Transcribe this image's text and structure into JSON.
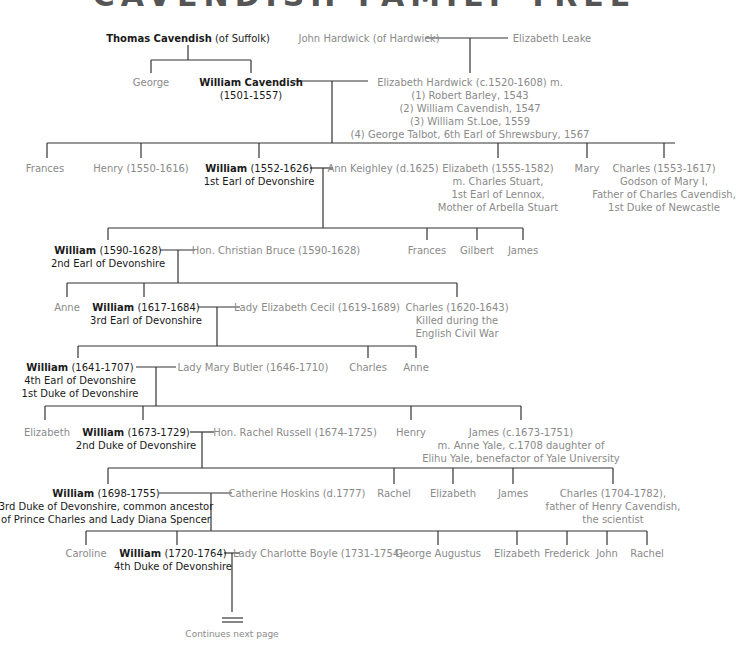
{
  "title": "CAVENDISH FAMILY TREE",
  "people": {
    "thomas": {
      "name": "Thomas Cavendish",
      "rest": " (of Suffolk)"
    },
    "john_hardwick": {
      "name": "John Hardwick (of Hardwick)"
    },
    "elizabeth_leake": {
      "name": "Elizabeth Leake"
    },
    "george": {
      "name": "George"
    },
    "william_1501": {
      "name": "William Cavendish",
      "line2": "(1501-1557)"
    },
    "bess": {
      "name": "Elizabeth Hardwick (c.1520-1608) m.",
      "lines": [
        "(1) Robert Barley, 1543",
        "(2) William Cavendish, 1547",
        "(3) William St.Loe, 1559",
        "(4) George Talbot, 6th Earl of Shrewsbury, 1567"
      ]
    },
    "frances_1": {
      "name": "Frances"
    },
    "henry_1550": {
      "name": "Henry (1550-1616)"
    },
    "william_1552": {
      "name": "William",
      "rest": " (1552-1626)",
      "line2": "1st Earl of Devonshire"
    },
    "ann_keighley": {
      "name": "Ann Keighley (d.1625)"
    },
    "elizabeth_1555": {
      "name": "Elizabeth (1555-1582)",
      "lines": [
        "m.  Charles Stuart,",
        "1st Earl of Lennox,",
        "Mother of Arbella Stuart"
      ]
    },
    "mary": {
      "name": "Mary"
    },
    "charles_1553": {
      "name": "Charles (1553-1617)",
      "lines": [
        "Godson of Mary I,",
        "Father of Charles Cavendish,",
        "1st Duke of Newcastle"
      ]
    },
    "william_1590": {
      "name": "William",
      "rest": " (1590-1628)",
      "line2": "2nd Earl of Devonshire"
    },
    "christian_bruce": {
      "name": "Hon.  Christian Bruce (1590-1628)"
    },
    "frances_2": {
      "name": "Frances"
    },
    "gilbert": {
      "name": "Gilbert"
    },
    "james_1": {
      "name": "James"
    },
    "anne_1": {
      "name": "Anne"
    },
    "william_1617": {
      "name": "William",
      "rest": " (1617-1684)",
      "line2": "3rd Earl of Devonshire"
    },
    "elizabeth_cecil": {
      "name": "Lady Elizabeth Cecil (1619-1689)"
    },
    "charles_1620": {
      "name": "Charles (1620-1643)",
      "lines": [
        "Killed during the",
        "English Civil War"
      ]
    },
    "william_1641": {
      "name": "William",
      "rest": " (1641-1707)",
      "line2": "4th Earl of Devonshire",
      "line3": "1st Duke of Devonshire"
    },
    "mary_butler": {
      "name": "Lady Mary Butler (1646-1710)"
    },
    "charles_2": {
      "name": "Charles"
    },
    "anne_2": {
      "name": "Anne"
    },
    "elizabeth_2": {
      "name": "Elizabeth"
    },
    "william_1673": {
      "name": "William",
      "rest": " (1673-1729)",
      "line2": "2nd Duke of Devonshire"
    },
    "rachel_russell": {
      "name": "Hon.  Rachel Russell (1674-1725)"
    },
    "henry_2": {
      "name": "Henry"
    },
    "james_1673": {
      "name": "James (c.1673-1751)",
      "lines": [
        "m.  Anne Yale, c.1708 daughter of",
        "Elihu Yale, benefactor of Yale University"
      ]
    },
    "william_1698": {
      "name": "William",
      "rest": " (1698-1755)",
      "line2": "3rd Duke of Devonshire, common ancestor",
      "line3": "of Prince Charles and Lady Diana Spencer"
    },
    "catherine_hoskins": {
      "name": "Catherine Hoskins (d.1777)"
    },
    "rachel_1": {
      "name": "Rachel"
    },
    "elizabeth_3": {
      "name": "Elizabeth"
    },
    "james_2": {
      "name": "James"
    },
    "charles_1704": {
      "name": "Charles (1704-1782),",
      "lines": [
        "father of Henry Cavendish,",
        "the scientist"
      ]
    },
    "caroline": {
      "name": "Caroline"
    },
    "william_1720": {
      "name": "William",
      "rest": " (1720-1764)",
      "line2": "4th Duke of Devonshire"
    },
    "charlotte_boyle": {
      "name": "Lady Charlotte Boyle (1731-1754)"
    },
    "george_augustus": {
      "name": "George Augustus"
    },
    "elizabeth_4": {
      "name": "Elizabeth"
    },
    "frederick": {
      "name": "Frederick"
    },
    "john": {
      "name": "John"
    },
    "rachel_2": {
      "name": "Rachel"
    }
  },
  "footer": {
    "continues": "Continues next page"
  },
  "colors": {
    "main_text": "#1a1a1a",
    "secondary_text": "#8a8a8a",
    "lines": "#333333"
  }
}
